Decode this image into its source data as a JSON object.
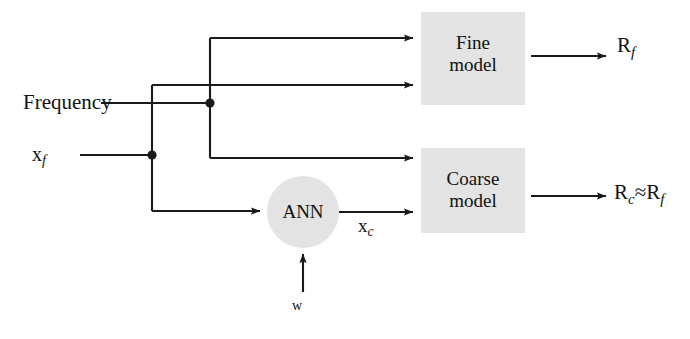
{
  "diagram": {
    "type": "block-diagram",
    "background_color": "#ffffff",
    "line_color": "#1a1a1a",
    "block_fill_color": "#e3e3e3",
    "inputs": [
      {
        "id": "frequency",
        "label": "Frequency"
      },
      {
        "id": "xf",
        "label_base": "x",
        "label_sub": "f"
      },
      {
        "id": "w",
        "label": "w"
      }
    ],
    "blocks": [
      {
        "id": "fine-model",
        "line1": "Fine",
        "line2": "model",
        "shape": "rectangle"
      },
      {
        "id": "coarse-model",
        "line1": "Coarse",
        "line2": "model",
        "shape": "rectangle"
      },
      {
        "id": "ann",
        "label": "ANN",
        "shape": "circle"
      }
    ],
    "signals": [
      {
        "id": "xc",
        "label_base": "x",
        "label_sub": "c"
      }
    ],
    "outputs": [
      {
        "id": "rf",
        "label_base": "R",
        "label_sub": "f"
      },
      {
        "id": "rc-approx-rf",
        "label_base": "R",
        "label_sub": "c",
        "relation": "≈",
        "label_base2": "R",
        "label_sub2": "f"
      }
    ]
  }
}
